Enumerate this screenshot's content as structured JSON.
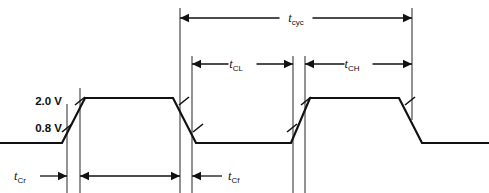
{
  "figure": {
    "kind": "timing-diagram",
    "background": "#ffffff",
    "line_color": "#111111",
    "reference_line_color": "#3a3a3a",
    "width": 489,
    "height": 193
  },
  "voltage_levels": [
    {
      "id": "vih",
      "label": "2.0 V",
      "y": 101
    },
    {
      "id": "vil",
      "label": "0.8 V",
      "y": 128
    }
  ],
  "signal": {
    "name": "clock",
    "high_y": 98,
    "low_y": 143,
    "points": "0,143 62,143 85,98 173,98 196,143 291,143 310,98 399,98 422,143 489,143"
  },
  "reference_lines": [
    {
      "id": "rise1-start",
      "x": 67,
      "y1": 104,
      "y2": 193
    },
    {
      "id": "rise1-end",
      "x": 80,
      "y1": 88,
      "y2": 193
    },
    {
      "id": "tcyc-start",
      "x": 180,
      "y1": 8,
      "y2": 193
    },
    {
      "id": "tcl-start",
      "x": 192,
      "y1": 56,
      "y2": 193
    },
    {
      "id": "tcl-end",
      "x": 293,
      "y1": 56,
      "y2": 193
    },
    {
      "id": "tch-start",
      "x": 305,
      "y1": 56,
      "y2": 193
    },
    {
      "id": "tcyc-end",
      "x": 412,
      "y1": 8,
      "y2": 120
    }
  ],
  "dimensions": [
    {
      "id": "tcyc",
      "label": "t",
      "subscript": "cyc",
      "label_x": 296,
      "label_y": 22,
      "line_y": 18,
      "x_start": 180,
      "x_end": 412,
      "arrows": "both",
      "label_inline": true
    },
    {
      "id": "tcl",
      "label": "t",
      "subscript": "CL",
      "label_x": 236,
      "label_y": 68,
      "line_y": 64,
      "x_start": 192,
      "x_end": 293,
      "arrows": "both",
      "label_inline": true
    },
    {
      "id": "tch",
      "label": "t",
      "subscript": "CH",
      "label_x": 352,
      "label_y": 68,
      "line_y": 64,
      "x_start": 305,
      "x_end": 412,
      "arrows": "both",
      "label_inline": true
    },
    {
      "id": "tcr",
      "label": "t",
      "subscript": "Cr",
      "label_x": 14,
      "label_y": 180,
      "line_y": 176,
      "x_start": 40,
      "x_end": 67,
      "arrows": "right",
      "label_inline": false
    },
    {
      "id": "pulse-width",
      "label": "",
      "subscript": "",
      "label_x": 0,
      "label_y": 0,
      "line_y": 176,
      "x_start": 80,
      "x_end": 180,
      "arrows": "both",
      "label_inline": false
    },
    {
      "id": "tcf",
      "label": "t",
      "subscript": "Cf",
      "label_x": 228,
      "label_y": 180,
      "line_y": 176,
      "x_start": 192,
      "x_end": 222,
      "arrows": "left",
      "label_inline": false
    }
  ],
  "edge_ticks": [
    {
      "id": "tick-rise1-vih",
      "x": 80,
      "y": 101
    },
    {
      "id": "tick-rise1-vil",
      "x": 67,
      "y": 128
    },
    {
      "id": "tick-fall1-vih",
      "x": 184,
      "y": 101
    },
    {
      "id": "tick-fall1-vil",
      "x": 198,
      "y": 128
    },
    {
      "id": "tick-rise2-vih",
      "x": 306,
      "y": 101
    },
    {
      "id": "tick-rise2-vil",
      "x": 292,
      "y": 128
    },
    {
      "id": "tick-fall2-vih",
      "x": 410,
      "y": 101
    }
  ]
}
